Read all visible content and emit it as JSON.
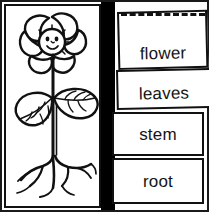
{
  "worksheet": {
    "title": "Plant parts labelling worksheet",
    "illustration": {
      "name": "flowering-plant",
      "alt": "Hand drawn flowering plant with a smiling flower, two leaves, a stem and branching roots",
      "parts": [
        "flower",
        "leaves",
        "stem",
        "root"
      ]
    },
    "cut_line": {
      "style": "dashed",
      "dash_count": 5
    },
    "labels": [
      {
        "id": "flower",
        "text": "flower"
      },
      {
        "id": "leaves",
        "text": "leaves"
      },
      {
        "id": "stem",
        "text": "stem"
      },
      {
        "id": "root",
        "text": "root"
      }
    ],
    "colors": {
      "ink": "#111111",
      "paper": "#ffffff",
      "divider": "#000000"
    }
  }
}
